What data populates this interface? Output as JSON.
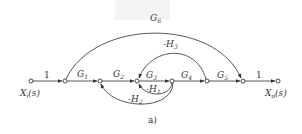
{
  "diagram": {
    "type": "signal-flow-graph",
    "caption": "a)",
    "input": {
      "label": "X",
      "subscript": "i",
      "suffix": "(s)"
    },
    "output": {
      "label": "X",
      "subscript": "o",
      "suffix": "(s)"
    },
    "nodes": [
      "Xi(s)",
      "n1",
      "n2",
      "n3",
      "n4",
      "n5",
      "n6",
      "Xo(s)"
    ],
    "forward_branches": [
      {
        "from": "Xi(s)",
        "to": "n1",
        "gain": "1"
      },
      {
        "from": "n1",
        "to": "n2",
        "gain": "G",
        "sub": "1"
      },
      {
        "from": "n2",
        "to": "n3",
        "gain": "G",
        "sub": "2"
      },
      {
        "from": "n3",
        "to": "n4",
        "gain": "G",
        "sub": "3"
      },
      {
        "from": "n4",
        "to": "n5",
        "gain": "G",
        "sub": "4"
      },
      {
        "from": "n5",
        "to": "n6",
        "gain": "G",
        "sub": "5"
      },
      {
        "from": "n6",
        "to": "Xo(s)",
        "gain": "1"
      }
    ],
    "feedforward_branches": [
      {
        "from": "n1",
        "to": "n6",
        "gain": "G",
        "sub": "6"
      }
    ],
    "feedback_branches": [
      {
        "from": "n5",
        "to": "n3",
        "gain": "-H",
        "sub": "3"
      },
      {
        "from": "n4",
        "to": "n3",
        "gain": "-H",
        "sub": "1"
      },
      {
        "from": "n4",
        "to": "n2",
        "gain": "-H",
        "sub": "2"
      }
    ]
  }
}
